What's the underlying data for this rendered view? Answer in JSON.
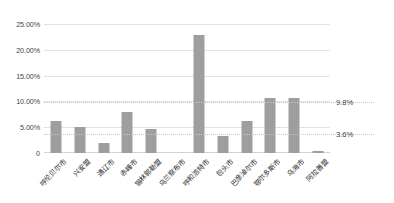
{
  "chart_data": {
    "type": "bar",
    "title": "",
    "subtitle": "",
    "xlabel": "",
    "ylabel": "",
    "ylim": [
      0,
      25
    ],
    "grid": true,
    "legend": false,
    "legend_position": "none",
    "y_ticks": [
      "0",
      "5.00%",
      "10.00%",
      "15.00%",
      "20.00%",
      "25.00%"
    ],
    "y_tick_values": [
      0,
      5,
      10,
      15,
      20,
      25
    ],
    "categories": [
      "呼伦贝尔市",
      "兴安盟",
      "通辽市",
      "赤峰市",
      "锡林郭勒盟",
      "乌兰察布市",
      "呼和浩特市",
      "包头市",
      "巴彦淖尔市",
      "鄂尔多斯市",
      "乌海市",
      "阿拉善盟"
    ],
    "values": [
      6.3,
      5.1,
      2.0,
      8.0,
      4.6,
      0.0,
      22.8,
      3.3,
      6.3,
      10.6,
      10.6,
      0.3
    ],
    "bar_color": "#9e9e9e",
    "annotations": [
      {
        "label": "9.8%",
        "value": 9.8,
        "line_color": "#b9c7d6"
      },
      {
        "label": "3.6%",
        "value": 3.6,
        "line_color": "#b9c7d6"
      }
    ]
  }
}
